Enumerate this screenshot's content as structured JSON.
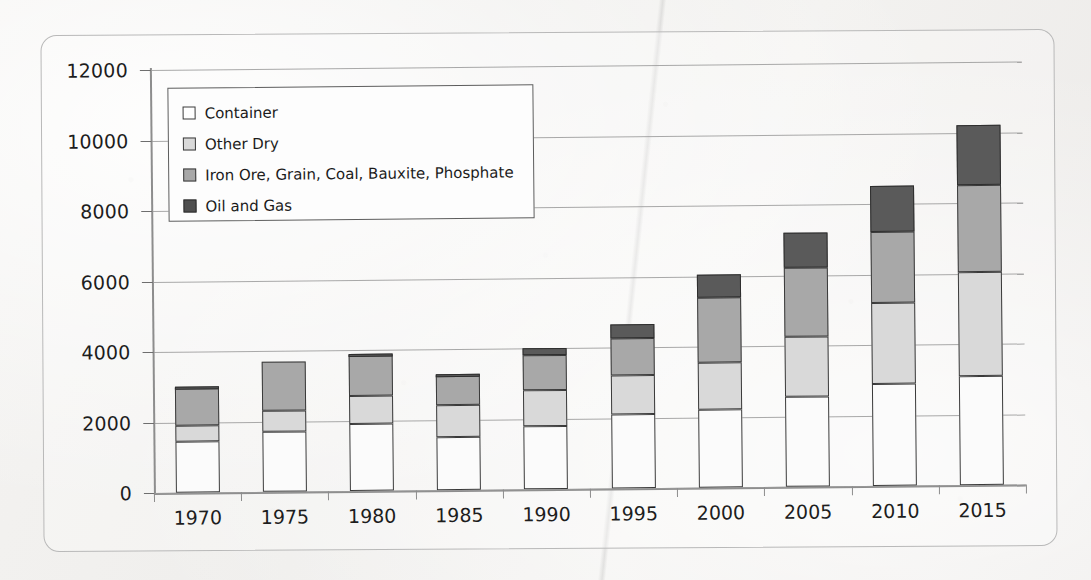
{
  "chart_data": {
    "type": "bar",
    "stacked": true,
    "title": "",
    "subtitle": "",
    "xlabel": "",
    "ylabel": "",
    "grid": true,
    "legend_position": "top-left-inside",
    "categories": [
      "1970",
      "1975",
      "1980",
      "1985",
      "1990",
      "1995",
      "2000",
      "2005",
      "2010",
      "2015"
    ],
    "ytick_labels": [
      "0",
      "2000",
      "4000",
      "6000",
      "8000",
      "10000",
      "12000"
    ],
    "ytick_values": [
      0,
      2000,
      4000,
      6000,
      8000,
      10000,
      12000
    ],
    "ylim": [
      0,
      12000
    ],
    "series": [
      {
        "name": "Oil and Gas",
        "color": "#5a5a5a",
        "values": [
          1440,
          1700,
          1900,
          1500,
          1800,
          2100,
          2200,
          2550,
          2900,
          3100
        ]
      },
      {
        "name": "Iron Ore, Grain, Coal, Bauxite, Phosphate",
        "color": "#a8a8a8",
        "values": [
          450,
          600,
          800,
          900,
          1000,
          1100,
          1350,
          1700,
          2300,
          2950
        ]
      },
      {
        "name": "Other Dry",
        "color": "#d9d9d9",
        "values": [
          1080,
          1400,
          1150,
          850,
          1000,
          1050,
          1850,
          1950,
          2000,
          2450
        ]
      },
      {
        "name": "Container",
        "color": "#fbfbfb",
        "values": [
          30,
          0,
          50,
          50,
          200,
          400,
          650,
          1000,
          1300,
          1700
        ]
      }
    ],
    "totals": [
      3000,
      3700,
      3900,
      3300,
      4000,
      4650,
      6050,
      7200,
      8500,
      10200
    ]
  },
  "legend": {
    "items": [
      {
        "label": "Container",
        "swatch": "s0"
      },
      {
        "label": "Other Dry",
        "swatch": "s1"
      },
      {
        "label": "Iron Ore, Grain, Coal, Bauxite, Phosphate",
        "swatch": "s2"
      },
      {
        "label": "Oil and Gas",
        "swatch": "s3"
      }
    ]
  }
}
